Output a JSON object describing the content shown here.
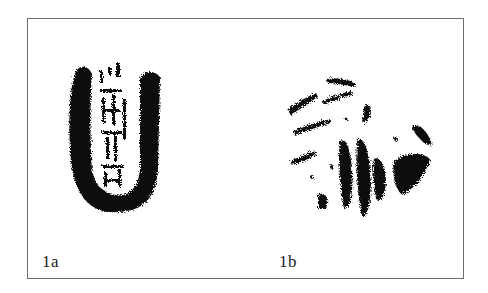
{
  "figure": {
    "panels": [
      {
        "id": "1a",
        "label": "1a",
        "subject": "seal impression rubbing (U-shaped, with inscribed characters)"
      },
      {
        "id": "1b",
        "label": "1b",
        "subject": "circular fragmentary rubbing"
      }
    ],
    "colors": {
      "ink": "#111111",
      "border": "#6f6f6f",
      "background": "#ffffff"
    }
  }
}
